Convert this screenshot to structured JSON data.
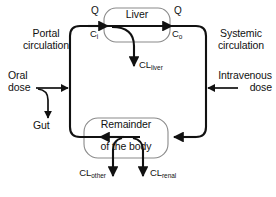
{
  "figure": {
    "type": "pharmacokinetic-flow-diagram",
    "background_color": "#ffffff",
    "line_color": "#111111",
    "organ_box_border_color": "#8a8a8a"
  },
  "organs": {
    "liver": {
      "label": "Liver",
      "shape": "rounded-rectangle"
    },
    "remainder": {
      "label_line1": "Remainder",
      "label_line2": "of the body",
      "shape": "rounded-rectangle"
    },
    "gut": {
      "label": "Gut"
    }
  },
  "flow_labels": {
    "q_in": "Q",
    "q_out": "Q",
    "c_in_base": "C",
    "c_in_sub": "i",
    "c_out_base": "C",
    "c_out_sub": "o"
  },
  "circulation_labels": {
    "portal_line1": "Portal",
    "portal_line2": "circulation",
    "systemic_line1": "Systemic",
    "systemic_line2": "circulation"
  },
  "dose_labels": {
    "oral_line1": "Oral",
    "oral_line2": "dose",
    "iv_line1": "Intravenous",
    "iv_line2": "dose"
  },
  "clearances": {
    "liver_base": "CL",
    "liver_sub": "liver",
    "other_base": "CL",
    "other_sub": "other",
    "renal_base": "CL",
    "renal_sub": "renal"
  }
}
